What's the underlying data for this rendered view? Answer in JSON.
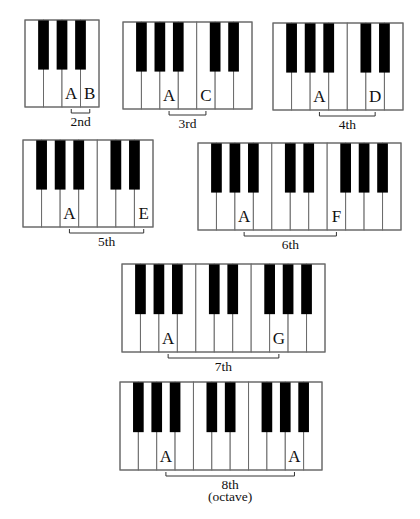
{
  "colors": {
    "white_key": "#ffffff",
    "black_key": "#000000",
    "outline": "#6a6a6a",
    "text": "#111111"
  },
  "keyboards": [
    {
      "id": "second",
      "x": 25,
      "y": 20,
      "w": 74,
      "h": 87,
      "white_keys": 4,
      "black_after": [
        0,
        1,
        2
      ],
      "notes": [
        {
          "key": 2,
          "label": "A"
        },
        {
          "key": 3,
          "label": "B"
        }
      ],
      "interval": {
        "from": 2,
        "to": 3,
        "label": "2nd",
        "sub": ""
      }
    },
    {
      "id": "third",
      "x": 123,
      "y": 22,
      "w": 129,
      "h": 87,
      "white_keys": 7,
      "black_after": [
        0,
        1,
        2,
        4,
        5
      ],
      "notes": [
        {
          "key": 2,
          "label": "A"
        },
        {
          "key": 4,
          "label": "C"
        }
      ],
      "interval": {
        "from": 2,
        "to": 4,
        "label": "3rd",
        "sub": ""
      }
    },
    {
      "id": "fourth",
      "x": 273,
      "y": 23,
      "w": 130,
      "h": 87,
      "white_keys": 7,
      "black_after": [
        0,
        1,
        2,
        4,
        5
      ],
      "notes": [
        {
          "key": 2,
          "label": "A"
        },
        {
          "key": 5,
          "label": "D"
        }
      ],
      "interval": {
        "from": 2,
        "to": 5,
        "label": "4th",
        "sub": ""
      }
    },
    {
      "id": "fifth",
      "x": 23,
      "y": 140,
      "w": 130,
      "h": 87,
      "white_keys": 7,
      "black_after": [
        0,
        1,
        2,
        4,
        5
      ],
      "notes": [
        {
          "key": 2,
          "label": "A"
        },
        {
          "key": 6,
          "label": "E"
        }
      ],
      "interval": {
        "from": 2,
        "to": 6,
        "label": "5th",
        "sub": ""
      }
    },
    {
      "id": "sixth",
      "x": 198,
      "y": 143,
      "w": 203,
      "h": 87,
      "white_keys": 11,
      "black_after": [
        0,
        1,
        2,
        4,
        5,
        7,
        8,
        9
      ],
      "notes": [
        {
          "key": 2,
          "label": "A"
        },
        {
          "key": 7,
          "label": "F"
        }
      ],
      "interval": {
        "from": 2,
        "to": 7,
        "label": "6th",
        "sub": ""
      }
    },
    {
      "id": "seventh",
      "x": 122,
      "y": 264,
      "w": 203,
      "h": 88,
      "white_keys": 11,
      "black_after": [
        0,
        1,
        2,
        4,
        5,
        7,
        8,
        9
      ],
      "notes": [
        {
          "key": 2,
          "label": "A"
        },
        {
          "key": 8,
          "label": "G"
        }
      ],
      "interval": {
        "from": 2,
        "to": 8,
        "label": "7th",
        "sub": ""
      }
    },
    {
      "id": "octave",
      "x": 120,
      "y": 382,
      "w": 202,
      "h": 88,
      "white_keys": 11,
      "black_after": [
        0,
        1,
        2,
        4,
        5,
        7,
        8,
        9
      ],
      "notes": [
        {
          "key": 2,
          "label": "A"
        },
        {
          "key": 9,
          "label": "A"
        }
      ],
      "interval": {
        "from": 2,
        "to": 9,
        "label": "8th",
        "sub": "(octave)"
      }
    }
  ]
}
